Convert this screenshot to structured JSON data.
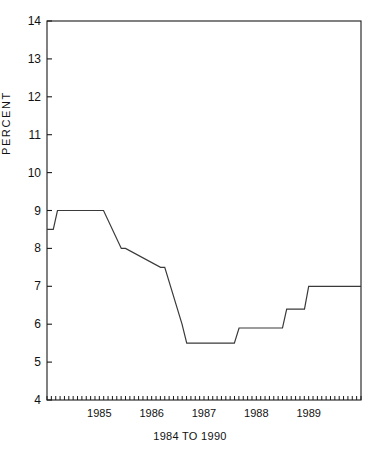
{
  "chart_data": {
    "type": "line",
    "title": "",
    "subtitle": "",
    "xlabel": "1984 TO 1990",
    "ylabel": "PERCENT",
    "xlim": [
      1984.0,
      1990.0
    ],
    "ylim": [
      4,
      14
    ],
    "grid": false,
    "legend": null,
    "y_ticks": [
      4,
      5,
      6,
      7,
      8,
      9,
      10,
      11,
      12,
      13,
      14
    ],
    "y_tick_labels": [
      "4",
      "5",
      "6",
      "7",
      "8",
      "9",
      "10",
      "11",
      "12",
      "13",
      "14"
    ],
    "x_ticks": [
      1985,
      1986,
      1987,
      1988,
      1989
    ],
    "x_tick_labels": [
      "1985",
      "1986",
      "1987",
      "1988",
      "1989"
    ],
    "x_minor_tick_interval_months": 1,
    "line_color": "#3a3a3a",
    "axis_color": "#1a1a1a",
    "series": [
      {
        "name": "Rate",
        "step": "post",
        "x": [
          1984.0,
          1984.12,
          1984.2,
          1985.0,
          1985.08,
          1985.42,
          1985.5,
          1986.17,
          1986.25,
          1986.58,
          1986.67,
          1987.58,
          1987.67,
          1988.5,
          1988.58,
          1988.92,
          1989.0,
          1990.0
        ],
        "y": [
          8.5,
          8.5,
          9.0,
          9.0,
          9.0,
          8.0,
          8.0,
          7.5,
          7.5,
          6.0,
          5.5,
          5.5,
          5.9,
          5.9,
          6.4,
          6.4,
          7.0,
          7.0
        ],
        "values_described": [
          {
            "period": "early 1984",
            "value": 8.5
          },
          {
            "period": "1984 to early 1985",
            "value": 9.0
          },
          {
            "period": "mid 1985",
            "value": 8.0
          },
          {
            "period": "late 1985 to early 1986",
            "value": 7.5
          },
          {
            "period": "mid 1986",
            "value": 6.0
          },
          {
            "period": "late 1986 to mid 1987",
            "value": 5.5
          },
          {
            "period": "late 1987 to mid 1988",
            "value": 5.9
          },
          {
            "period": "late 1988",
            "value": 6.4
          },
          {
            "period": "1989 to 1990",
            "value": 7.0
          }
        ]
      }
    ]
  },
  "plot_frame": {
    "left": 47,
    "right": 361,
    "top": 21,
    "bottom": 400
  }
}
